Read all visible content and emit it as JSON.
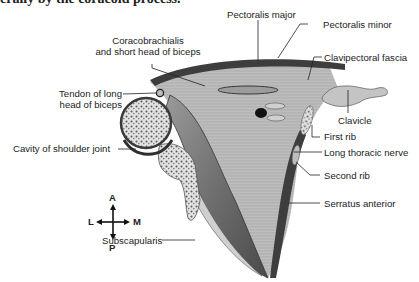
{
  "caption_fragment": "erally by the coracoid process.",
  "labels": {
    "pectoralis_major": "Pectoralis major",
    "pectoralis_minor": "Pectoralis minor",
    "clavipectoral_fascia": "Clavipectoral fascia",
    "coracobrachialis_line1": "Coracobrachialis",
    "coracobrachialis_line2": "and short head of biceps",
    "tendon_line1": "Tendon of long",
    "tendon_line2": "head of biceps",
    "cavity": "Cavity of shoulder joint",
    "clavicle": "Clavicle",
    "first_rib": "First rib",
    "long_thoracic_nerve": "Long thoracic nerve",
    "second_rib": "Second rib",
    "serratus_anterior": "Serratus anterior",
    "subscapularis": "Subscapularis"
  },
  "compass": {
    "up": "A",
    "down": "P",
    "left": "L",
    "right": "M"
  },
  "colors": {
    "muscle": "#8a8a8a",
    "muscle_dark": "#3a3a3a",
    "fascia": "#c8c8c8",
    "bone": "#d9d9d9",
    "bone_spot": "#6a6a6a",
    "line": "#222222"
  }
}
